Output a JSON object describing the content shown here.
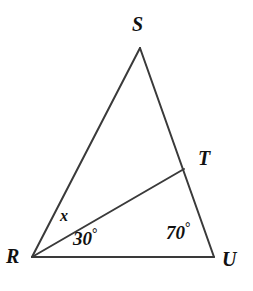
{
  "figure": {
    "type": "geometry-diagram",
    "shape": "triangle",
    "background_color": "#ffffff",
    "stroke_color": "#3a3a3a",
    "stroke_width": 2,
    "width": 253,
    "height": 291,
    "vertices": [
      {
        "id": "S",
        "label": "S",
        "x": 140,
        "y": 48,
        "label_x": 132,
        "label_y": 14
      },
      {
        "id": "T",
        "label": "T",
        "x": 184,
        "y": 169,
        "label_x": 198,
        "label_y": 148
      },
      {
        "id": "R",
        "label": "R",
        "x": 32,
        "y": 257,
        "label_x": 6,
        "label_y": 246
      },
      {
        "id": "U",
        "label": "U",
        "x": 214,
        "y": 257,
        "label_x": 222,
        "label_y": 249
      }
    ],
    "segments": [
      {
        "id": "RS",
        "from": "R",
        "to": "S"
      },
      {
        "id": "SU",
        "from": "S",
        "to": "U"
      },
      {
        "id": "RU",
        "from": "R",
        "to": "U"
      },
      {
        "id": "RT",
        "from": "R",
        "to": "T"
      }
    ],
    "angles": [
      {
        "id": "angle-SRT",
        "label": "x",
        "value": null,
        "degree_symbol": false,
        "label_x": 60,
        "label_y": 208
      },
      {
        "id": "angle-TRU",
        "label": "30",
        "value": 30,
        "degree_symbol": true,
        "label_x": 73,
        "label_y": 227
      },
      {
        "id": "angle-TUR",
        "label": "70",
        "value": 70,
        "degree_symbol": true,
        "label_x": 166,
        "label_y": 221
      }
    ],
    "degree_symbol": "°"
  }
}
